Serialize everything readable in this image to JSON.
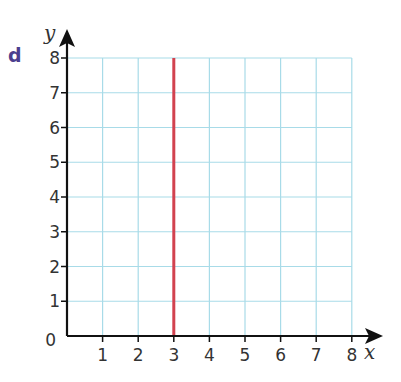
{
  "part_label": "d",
  "chart_data": {
    "type": "line",
    "title": "",
    "xlabel": "x",
    "ylabel": "y",
    "xlim": [
      0,
      8
    ],
    "ylim": [
      0,
      8
    ],
    "x_ticks": [
      "1",
      "2",
      "3",
      "4",
      "5",
      "6",
      "7",
      "8"
    ],
    "y_ticks": [
      "0",
      "1",
      "2",
      "3",
      "4",
      "5",
      "6",
      "7",
      "8"
    ],
    "grid": true,
    "series": [
      {
        "name": "x = 3",
        "x": [
          3,
          3
        ],
        "y": [
          0,
          8
        ],
        "color": "#d2424f"
      }
    ]
  },
  "colors": {
    "grid": "#a8dbe8",
    "axis": "#111111",
    "line": "#d2424f",
    "part_label": "#4b3f8f"
  }
}
